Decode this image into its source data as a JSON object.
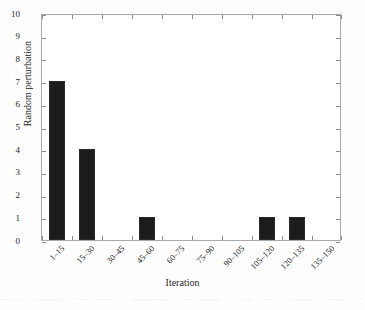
{
  "figure": {
    "background_color": "#fefefe",
    "plot_background_color": "#ffffff",
    "axis_color": "#a9a9a9",
    "bar_color": "#1c1c1c"
  },
  "chart_data": {
    "type": "bar",
    "title": "",
    "xlabel": "Iteration",
    "ylabel": "Random perturbation",
    "categories": [
      "1–15",
      "15–30",
      "30–45",
      "45–60",
      "60–75",
      "75–90",
      "90–105",
      "105–120",
      "120–135",
      "135–150"
    ],
    "values": [
      7,
      4,
      0,
      1,
      0,
      0,
      0,
      1,
      1,
      0
    ],
    "ylim": [
      0,
      10
    ],
    "ytick_labels": [
      "0",
      "1",
      "2",
      "3",
      "4",
      "5",
      "6",
      "7",
      "8",
      "9",
      "10"
    ],
    "ytick_values": [
      0,
      1,
      2,
      3,
      4,
      5,
      6,
      7,
      8,
      9,
      10
    ],
    "grid": false,
    "legend": null,
    "legend_position": "none",
    "bar_color": "#1c1c1c"
  },
  "artifact": {
    "text": "— — ·· ——— · ··—· —— · ·· ———— ·· — · —— ·· ·· — ·· — · ·· ——· ·· —— · ·· — ·"
  }
}
